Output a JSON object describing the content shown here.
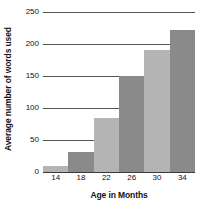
{
  "chart_data": {
    "type": "bar",
    "title": "",
    "subtitle": "",
    "xlabel": "Age in Months",
    "ylabel": "Average number of words used",
    "categories": [
      "14",
      "18",
      "22",
      "26",
      "30",
      "34"
    ],
    "values": [
      10,
      32,
      85,
      150,
      190,
      222
    ],
    "series": [
      {
        "name": "Average number of words used",
        "values": [
          10,
          32,
          85,
          150,
          190,
          222
        ]
      }
    ],
    "ylim": [
      0,
      250
    ],
    "yticks": [
      "0",
      "50",
      "100",
      "150",
      "200",
      "250"
    ],
    "ytick_values": [
      0,
      50,
      100,
      150,
      200,
      250
    ],
    "xticks": [
      "14",
      "18",
      "22",
      "26",
      "30",
      "34"
    ],
    "grid": true,
    "legend": false,
    "legend_position": "none",
    "bar_gap": 0,
    "colors": {
      "bar_light": "#b4b4b4",
      "bar_dark": "#8a8a8a",
      "gridline": "#55565a",
      "axis": "#3a3b3e",
      "text": "#111111",
      "background": "#ffffff"
    },
    "bar_colors": [
      "#b4b4b4",
      "#8a8a8a",
      "#b4b4b4",
      "#8a8a8a",
      "#b4b4b4",
      "#8a8a8a"
    ],
    "annotations": []
  }
}
